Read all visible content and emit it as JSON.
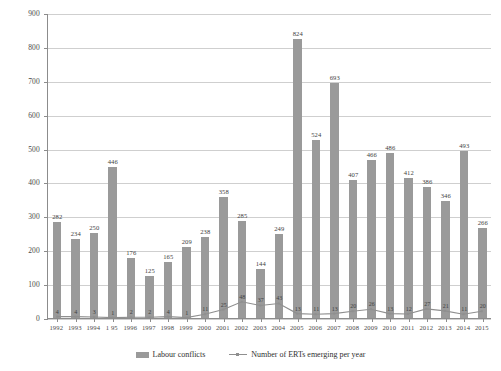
{
  "chart_data": {
    "type": "bar",
    "title": "",
    "xlabel": "",
    "ylabel": "",
    "ylim": [
      0,
      900
    ],
    "ytick_values": [
      0,
      100,
      200,
      300,
      400,
      500,
      600,
      700,
      800,
      900
    ],
    "ytick_labels": [
      "0",
      "100",
      "200",
      "300",
      "400",
      "500",
      "600",
      "700",
      "800",
      "900"
    ],
    "grid": true,
    "legend_position": "bottom",
    "categories": [
      "1992",
      "1993",
      "1994",
      "1 95",
      "1996",
      "1997",
      "1998",
      "1999",
      "2000",
      "2001",
      "2002",
      "2003",
      "2004",
      "2005",
      "2006",
      "2007",
      "2008",
      "2009",
      "2010",
      "2011",
      "2012",
      "2013",
      "2014",
      "2015"
    ],
    "series": [
      {
        "name": "Labour conflicts",
        "type": "bar",
        "color": "#9a9a9a",
        "values": [
          282,
          234,
          250,
          446,
          176,
          125,
          165,
          209,
          238,
          358,
          285,
          144,
          249,
          824,
          524,
          693,
          407,
          466,
          486,
          412,
          386,
          346,
          493,
          266
        ]
      },
      {
        "name": "Number of ERTs emerging per year",
        "type": "line",
        "color": "#8f8f8f",
        "values": [
          4,
          4,
          3,
          1,
          2,
          2,
          4,
          1,
          11,
          25,
          48,
          37,
          43,
          13,
          11,
          13,
          20,
          26,
          13,
          12,
          27,
          21,
          11,
          20
        ]
      }
    ]
  },
  "legend": {
    "items": [
      {
        "label": "Labour conflicts",
        "marker": "bar-swatch"
      },
      {
        "label": "Number of ERTs emerging per year",
        "marker": "line-swatch"
      }
    ]
  }
}
